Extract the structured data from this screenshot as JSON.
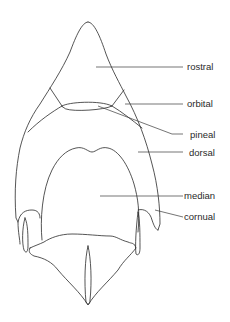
{
  "diagram": {
    "labels": [
      {
        "id": "rostral",
        "text": "rostral"
      },
      {
        "id": "orbital",
        "text": "orbital"
      },
      {
        "id": "pineal",
        "text": "pineal"
      },
      {
        "id": "dorsal",
        "text": "dorsal"
      },
      {
        "id": "median",
        "text": "median"
      },
      {
        "id": "cornual",
        "text": "cornual"
      }
    ],
    "colors": {
      "line": "#2a2a2a",
      "background": "#ffffff"
    }
  }
}
